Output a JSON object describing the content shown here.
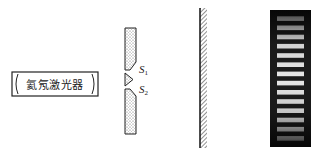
{
  "diagram": {
    "laser": {
      "label": "氦氖激光器"
    },
    "double_slit": {
      "slits": [
        {
          "name": "S",
          "subscript": "1"
        },
        {
          "name": "S",
          "subscript": "2"
        }
      ]
    },
    "screen": {
      "kind": "hatched-wall"
    },
    "fringe_pattern": {
      "bright_fringe_count": 14,
      "background_color": "#1c1c1c",
      "fringe_color": "#e8e8e8"
    }
  }
}
